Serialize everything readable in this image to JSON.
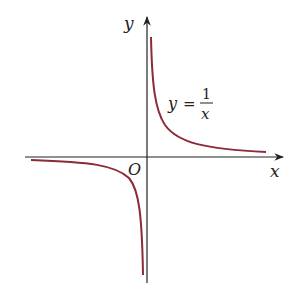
{
  "diagram": {
    "axes": {
      "x_label": "x",
      "y_label": "y",
      "origin_label": "O"
    },
    "equation": {
      "lhs": "y",
      "equals": "=",
      "numerator": "1",
      "denominator": "x"
    },
    "colors": {
      "curve": "#8b2a3a",
      "axis": "#222222",
      "background": "#ffffff"
    }
  }
}
